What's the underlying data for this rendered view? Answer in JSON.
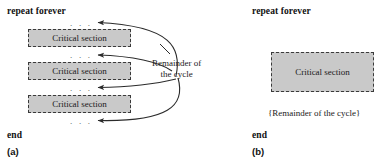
{
  "figure": {
    "panels": [
      {
        "id": "a",
        "caption": "(a)",
        "repeat_label": "repeat forever",
        "end_label": "end",
        "critical_section_label": "Critical section",
        "ellipsis": ". . .",
        "annotation_line1": "Remainder of",
        "annotation_line2": "the cycle",
        "critical_sections": [
          {
            "label": "Critical section"
          },
          {
            "label": "Critical section"
          },
          {
            "label": "Critical section"
          }
        ],
        "ellipses": [
          ". . .",
          ". . .",
          ". . .",
          ". . ."
        ]
      },
      {
        "id": "b",
        "caption": "(b)",
        "repeat_label": "repeat forever",
        "end_label": "end",
        "critical_section_label": "Critical section",
        "remainder_label": "{Remainder of the cycle}"
      }
    ]
  },
  "colors": {
    "box_fill": "#c9c9c9",
    "box_border": "#3a3a3a",
    "text": "#111111",
    "arrow": "#2b2b2b",
    "background": "#ffffff"
  }
}
